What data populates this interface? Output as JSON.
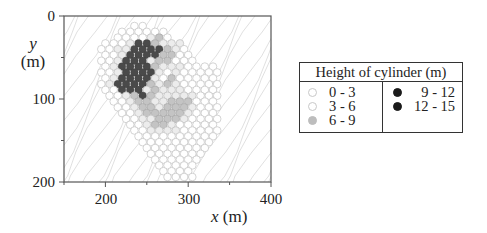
{
  "chart_data": {
    "type": "scatter",
    "subtype": "hexagonal cylinder map over contour background",
    "title": "",
    "xlabel": "x (m)",
    "ylabel": "y (m)",
    "xlim": [
      150,
      400
    ],
    "ylim": [
      200,
      0
    ],
    "y_inverted": true,
    "x_ticks": [
      200,
      300,
      400
    ],
    "y_ticks": [
      0,
      100,
      200
    ],
    "grid": false,
    "legend": {
      "title": "Height of cylinder (m)",
      "position": "right",
      "entries": [
        {
          "label": "0 - 3",
          "color": "#ffffff",
          "edge": "#bbbbbb"
        },
        {
          "label": "3 - 6",
          "color": "#eeeeee",
          "edge": "#bbbbbb"
        },
        {
          "label": "6 - 9",
          "color": "#b8b8b8",
          "edge": "#999999"
        },
        {
          "label": "9 - 12",
          "color": "#222222",
          "edge": "#111111"
        },
        {
          "label": "12 - 15",
          "color": "#222222",
          "edge": "#111111"
        }
      ]
    },
    "cell_spacing_m": 10,
    "rows": [
      {
        "y": 12,
        "x_start": 235,
        "x_end": 245,
        "classes": "00"
      },
      {
        "y": 19,
        "x_start": 220,
        "x_end": 270,
        "classes": "000000"
      },
      {
        "y": 26,
        "x_start": 215,
        "x_end": 275,
        "classes": "0000120"
      },
      {
        "y": 33,
        "x_start": 200,
        "x_end": 290,
        "classes": "0001332111"
      },
      {
        "y": 40,
        "x_start": 195,
        "x_end": 295,
        "classes": "00113333210"
      },
      {
        "y": 47,
        "x_start": 200,
        "x_end": 300,
        "classes": "00133332200"
      },
      {
        "y": 54,
        "x_start": 195,
        "x_end": 305,
        "classes": "001333122000"
      },
      {
        "y": 61,
        "x_start": 200,
        "x_end": 330,
        "classes": "01333321110000"
      },
      {
        "y": 68,
        "x_start": 195,
        "x_end": 335,
        "classes": "001333310100000"
      },
      {
        "y": 75,
        "x_start": 200,
        "x_end": 330,
        "classes": "01333310200000"
      },
      {
        "y": 82,
        "x_start": 195,
        "x_end": 335,
        "classes": "013333212100000"
      },
      {
        "y": 89,
        "x_start": 200,
        "x_end": 330,
        "classes": "00333121110000"
      },
      {
        "y": 96,
        "x_start": 205,
        "x_end": 335,
        "classes": "00123211111000"
      },
      {
        "y": 103,
        "x_start": 210,
        "x_end": 330,
        "classes": "0012211222000"
      },
      {
        "y": 110,
        "x_start": 215,
        "x_end": 335,
        "classes": "0012212221000"
      },
      {
        "y": 117,
        "x_start": 220,
        "x_end": 330,
        "classes": "001222221000"
      },
      {
        "y": 124,
        "x_start": 225,
        "x_end": 335,
        "classes": "00112221000"
      },
      {
        "y": 131,
        "x_start": 230,
        "x_end": 330,
        "classes": "00122100000"
      },
      {
        "y": 138,
        "x_start": 235,
        "x_end": 335,
        "classes": "0011110000"
      },
      {
        "y": 145,
        "x_start": 240,
        "x_end": 330,
        "classes": "0000000000"
      },
      {
        "y": 152,
        "x_start": 245,
        "x_end": 325,
        "classes": "000000000"
      },
      {
        "y": 159,
        "x_start": 250,
        "x_end": 320,
        "classes": "00000000"
      },
      {
        "y": 166,
        "x_start": 255,
        "x_end": 315,
        "classes": "0000000"
      },
      {
        "y": 173,
        "x_start": 260,
        "x_end": 310,
        "classes": "000000"
      },
      {
        "y": 180,
        "x_start": 265,
        "x_end": 305,
        "classes": "00000"
      },
      {
        "y": 187,
        "x_start": 270,
        "x_end": 300,
        "classes": "0000"
      },
      {
        "y": 194,
        "x_start": 275,
        "x_end": 305,
        "classes": "0000"
      }
    ]
  },
  "axes": {
    "y_ticks": [
      "0",
      "100",
      "200"
    ],
    "x_ticks": [
      "200",
      "300",
      "400"
    ],
    "y_label_var": "y",
    "y_label_unit": "(m)",
    "x_label_var": "x",
    "x_label_unit": " (m)"
  },
  "legend": {
    "title": "Height of cylinder (m)",
    "left": [
      {
        "label": "0 - 3",
        "fill": "#ffffff",
        "edge": "#c8c8c8"
      },
      {
        "label": "3 - 6",
        "fill": "#ffffff",
        "edge": "#c8c8c8"
      },
      {
        "label": "6 - 9",
        "fill": "#bdbdbd",
        "edge": "#bdbdbd"
      }
    ],
    "right": [
      {
        "label": "  9 - 12",
        "fill": "#1a1a1a",
        "edge": "#1a1a1a"
      },
      {
        "label": "12 - 15",
        "fill": "#1a1a1a",
        "edge": "#1a1a1a"
      }
    ]
  },
  "colors": {
    "frame": "#555555",
    "contour": "#d6d6d6",
    "class_fill": [
      "#ffffff",
      "#ececec",
      "#c4c4c4",
      "#4a4a4a"
    ],
    "class_edge": [
      "#c2c2c2",
      "#bdbdbd",
      "#a8a8a8",
      "#3a3a3a"
    ]
  }
}
